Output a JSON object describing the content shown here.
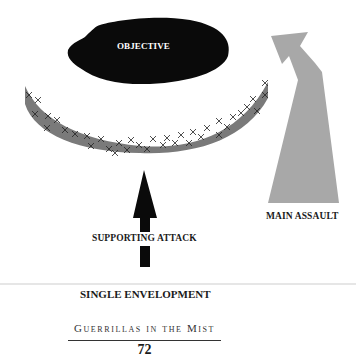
{
  "diagram": {
    "objective_label": "OBJECTIVE",
    "supporting_attack_label": "SUPPORTING ATTACK",
    "main_assault_label": "MAIN ASSAULT",
    "caption": "SINGLE ENVELOPMENT",
    "colors": {
      "objective": "#0a0a0a",
      "enemy_line": "#7a7a7a",
      "supporting_arrow": "#0a0a0a",
      "main_assault_arrow": "#a8a8a8"
    }
  },
  "footer": {
    "book_title": "Guerrillas in the Mist",
    "page_number": "72"
  }
}
